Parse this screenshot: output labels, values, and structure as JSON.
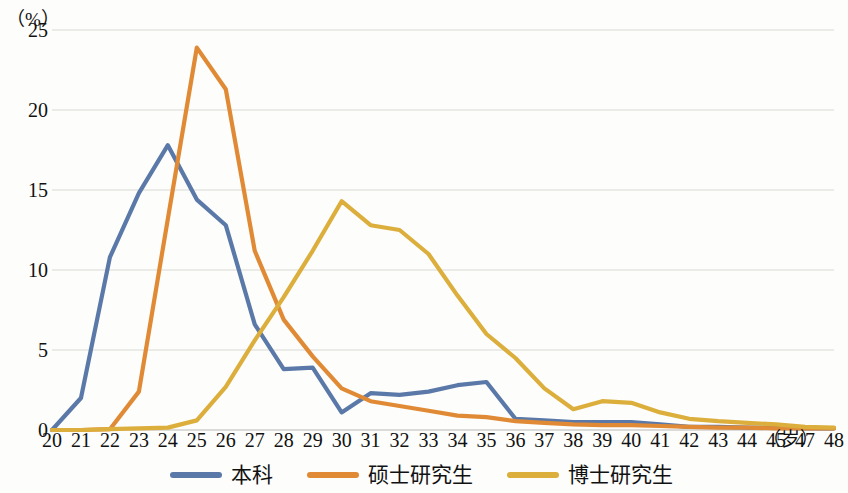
{
  "chart_data": {
    "type": "line",
    "title": "",
    "subtitle": "",
    "xlabel": "（岁）",
    "ylabel": "（%）",
    "x": [
      20,
      21,
      22,
      23,
      24,
      25,
      26,
      27,
      28,
      29,
      30,
      31,
      32,
      33,
      34,
      35,
      36,
      37,
      38,
      39,
      40,
      41,
      42,
      43,
      44,
      45,
      47,
      48
    ],
    "categories": [
      "20",
      "21",
      "22",
      "23",
      "24",
      "25",
      "26",
      "27",
      "28",
      "29",
      "30",
      "31",
      "32",
      "33",
      "34",
      "35",
      "36",
      "37",
      "38",
      "39",
      "40",
      "41",
      "42",
      "43",
      "44",
      "45",
      "47",
      "48"
    ],
    "xlim": [
      20,
      48
    ],
    "ylim": [
      0,
      25
    ],
    "yticks": [
      0,
      5,
      10,
      15,
      20,
      25
    ],
    "grid": "horizontal",
    "legend_position": "bottom-center",
    "series": [
      {
        "name": "本科",
        "color": "#5b79a8",
        "values": [
          0,
          2.0,
          10.8,
          14.8,
          17.8,
          14.4,
          12.8,
          6.6,
          3.8,
          3.9,
          1.1,
          2.3,
          2.2,
          2.4,
          2.8,
          3.0,
          0.7,
          0.6,
          0.5,
          0.5,
          0.5,
          0.35,
          0.2,
          0.2,
          0.15,
          0.15,
          0.1,
          0.1
        ]
      },
      {
        "name": "硕士研究生",
        "color": "#e08a35",
        "values": [
          0,
          0,
          0.05,
          2.4,
          13.2,
          23.9,
          21.3,
          11.2,
          6.9,
          4.6,
          2.6,
          1.8,
          1.5,
          1.2,
          0.9,
          0.8,
          0.55,
          0.45,
          0.35,
          0.3,
          0.3,
          0.25,
          0.2,
          0.15,
          0.15,
          0.1,
          0.1,
          0.1
        ]
      },
      {
        "name": "博士研究生",
        "color": "#dcae3c",
        "values": [
          0,
          0,
          0.05,
          0.1,
          0.15,
          0.6,
          2.7,
          5.6,
          8.3,
          11.2,
          14.3,
          12.8,
          12.5,
          11.0,
          8.4,
          6.0,
          4.5,
          2.6,
          1.3,
          1.8,
          1.7,
          1.1,
          0.7,
          0.55,
          0.45,
          0.35,
          0.2,
          0.15
        ]
      }
    ]
  }
}
